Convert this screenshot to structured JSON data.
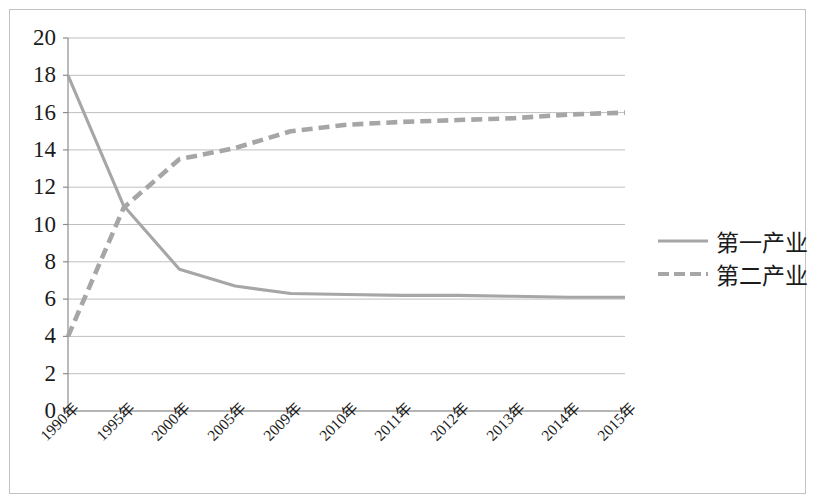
{
  "chart_data": {
    "type": "line",
    "title": "",
    "subtitle": "",
    "xlabel": "",
    "ylabel": "",
    "ylim": [
      0,
      20
    ],
    "ytick_values": [
      0,
      2,
      4,
      6,
      8,
      10,
      12,
      14,
      16,
      18,
      20
    ],
    "ytick_labels": [
      "0",
      "2",
      "4",
      "6",
      "8",
      "10",
      "12",
      "14",
      "16",
      "18",
      "20"
    ],
    "grid": "horizontal",
    "legend_position": "right",
    "categories": [
      "1990年",
      "1995年",
      "2000年",
      "2005年",
      "2009年",
      "2010年",
      "2011年",
      "2012年",
      "2013年",
      "2014年",
      "2015年"
    ],
    "series": [
      {
        "name": "第一产业",
        "style": "solid",
        "color": "#a6a6a6",
        "values": [
          18.0,
          11.0,
          7.6,
          6.7,
          6.3,
          6.25,
          6.2,
          6.2,
          6.15,
          6.1,
          6.1
        ]
      },
      {
        "name": "第二产业",
        "style": "dashed",
        "color": "#a6a6a6",
        "values": [
          4.0,
          10.9,
          13.5,
          14.1,
          15.0,
          15.35,
          15.5,
          15.6,
          15.7,
          15.9,
          16.0
        ]
      }
    ]
  },
  "legend": {
    "items": [
      {
        "label": "第一产业",
        "style": "solid"
      },
      {
        "label": "第二产业",
        "style": "dashed"
      }
    ]
  },
  "axes": {
    "plot_left": 68,
    "plot_right": 625,
    "plot_top": 38,
    "plot_bottom": 411
  },
  "colors": {
    "line": "#a6a6a6",
    "gridline": "#bfbfbf",
    "axis": "#8c8c8c",
    "frame": "#c3c3c3",
    "text": "#1b1b1b"
  }
}
